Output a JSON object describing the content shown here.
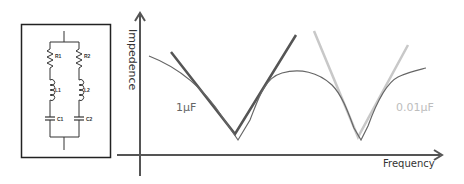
{
  "circuit": {
    "components": [
      {
        "label": "R1",
        "type": "resistor",
        "branch": "left"
      },
      {
        "label": "R2",
        "type": "resistor",
        "branch": "right"
      },
      {
        "label": "L1",
        "type": "inductor",
        "branch": "left"
      },
      {
        "label": "L2",
        "type": "inductor",
        "branch": "right"
      },
      {
        "label": "C1",
        "type": "capacitor",
        "branch": "left"
      },
      {
        "label": "C2",
        "type": "capacitor",
        "branch": "right"
      }
    ]
  },
  "plot": {
    "y_axis_label": "Impedence",
    "x_axis_label": "Frequency",
    "annotations": {
      "cap1": "1μF",
      "cap2": "0.01μF"
    },
    "colors": {
      "axis": "#555555",
      "cap1_line": "#555555",
      "cap2_line": "#c8c8c8",
      "combined_curve": "#666666",
      "cap1_text": "#666666",
      "cap2_text": "#bdbdbd"
    }
  }
}
